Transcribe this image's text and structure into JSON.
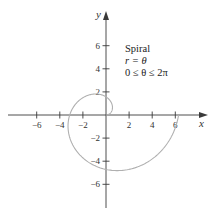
{
  "chart_data": {
    "type": "line",
    "title": "Spiral",
    "subtitle_lines": [
      "Spiral",
      "r = θ",
      "0 ≤ θ ≤ 2π"
    ],
    "xlabel": "x",
    "ylabel": "y",
    "xlim": [
      -8,
      8.5
    ],
    "ylim": [
      -8,
      9
    ],
    "x_ticks": [
      -6,
      -4,
      -2,
      2,
      4,
      6
    ],
    "x_tick_labels": [
      "−6",
      "−4",
      "−2",
      "2",
      "4",
      "6"
    ],
    "y_ticks": [
      -6,
      -4,
      -2,
      2,
      4,
      6
    ],
    "y_tick_labels": [
      "−6",
      "−4",
      "−2",
      "2",
      "4",
      "6"
    ],
    "grid": false,
    "legend": "none",
    "series": [
      {
        "name": "r = θ",
        "parametric": "x = θ·cos(θ), y = θ·sin(θ)",
        "theta_range": [
          0,
          6.2832
        ],
        "color": "#b0b0b0",
        "points": [
          [
            0,
            0
          ],
          [
            0.71,
            0.38
          ],
          [
            1.08,
            1.65
          ],
          [
            0.99,
            3.04
          ],
          [
            -0.13,
            4.7
          ],
          [
            -1.76,
            4.08
          ],
          [
            -3.17,
            2.38
          ],
          [
            -3.63,
            0.64
          ],
          [
            -3.14,
            0
          ],
          [
            -4.01,
            -1.63
          ],
          [
            -3.88,
            -3.44
          ],
          [
            -2.21,
            -4.99
          ],
          [
            -0.0,
            -4.71
          ],
          [
            1.92,
            -4.85
          ],
          [
            3.74,
            -3.93
          ],
          [
            5.02,
            -1.93
          ],
          [
            6.28,
            0
          ]
        ]
      }
    ],
    "annotations": [
      {
        "text": "Spiral",
        "x": 1.7,
        "y": 5.8
      },
      {
        "text": "r = θ",
        "x": 1.7,
        "y": 4.8
      },
      {
        "text": "0 ≤ θ ≤ 2π",
        "x": 1.7,
        "y": 3.8
      }
    ]
  },
  "colors": {
    "axis": "#3a3a3a",
    "curve": "#b5b5b5",
    "text": "#333333"
  }
}
